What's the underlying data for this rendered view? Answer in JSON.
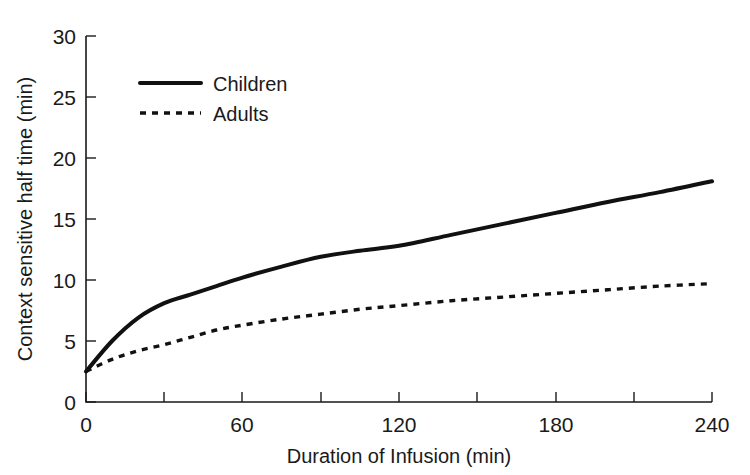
{
  "chart_data": {
    "type": "line",
    "title": "",
    "xlabel": "Duration of Infusion (min)",
    "ylabel": "Context sensitive half time (min)",
    "xlim": [
      0,
      240
    ],
    "ylim": [
      0,
      30
    ],
    "grid": false,
    "legend_position": "top-left",
    "x_ticks": [
      0,
      60,
      120,
      180,
      240
    ],
    "x_tick_labels": [
      "0",
      "60",
      "120",
      "180",
      "240"
    ],
    "x_minor_ticks": [
      30,
      90,
      150,
      210
    ],
    "y_ticks": [
      0,
      5,
      10,
      15,
      20,
      25,
      30
    ],
    "y_tick_labels": [
      "0",
      "5",
      "10",
      "15",
      "20",
      "25",
      "30"
    ],
    "x": [
      0,
      10,
      20,
      30,
      40,
      50,
      60,
      75,
      90,
      105,
      120,
      140,
      160,
      180,
      200,
      220,
      240
    ],
    "series": [
      {
        "name": "Children",
        "style": "solid",
        "color": "#111111",
        "values": [
          2.5,
          5.0,
          6.9,
          8.1,
          8.8,
          9.5,
          10.2,
          11.1,
          11.9,
          12.4,
          12.8,
          13.7,
          14.6,
          15.5,
          16.4,
          17.2,
          18.1
        ]
      },
      {
        "name": "Adults",
        "style": "dashed",
        "color": "#111111",
        "values": [
          2.5,
          3.5,
          4.2,
          4.7,
          5.3,
          5.9,
          6.3,
          6.8,
          7.2,
          7.6,
          7.9,
          8.3,
          8.6,
          8.9,
          9.2,
          9.5,
          9.7
        ]
      }
    ]
  },
  "legend": {
    "items": [
      {
        "label": "Children"
      },
      {
        "label": "Adults"
      }
    ]
  },
  "axes": {
    "x_title": "Duration of Infusion (min)",
    "y_title": "Context sensitive half time (min)"
  }
}
